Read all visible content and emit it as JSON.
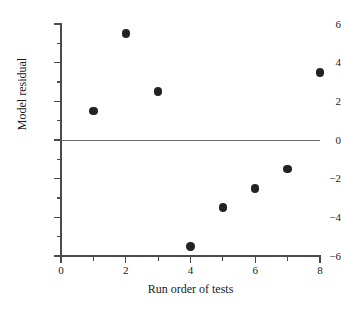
{
  "chart_data": {
    "type": "scatter",
    "title": "",
    "xlabel": "Run order of tests",
    "ylabel": "Model residual",
    "x": [
      1,
      2,
      3,
      4,
      5,
      6,
      7,
      8
    ],
    "values": [
      1.5,
      5.5,
      2.5,
      -5.5,
      -3.5,
      -2.5,
      -1.5,
      3.5
    ],
    "points": [
      {
        "x": 1,
        "y": 1.5
      },
      {
        "x": 2,
        "y": 5.5
      },
      {
        "x": 3,
        "y": 2.5
      },
      {
        "x": 4,
        "y": -5.5
      },
      {
        "x": 5,
        "y": -3.5
      },
      {
        "x": 6,
        "y": -2.5
      },
      {
        "x": 7,
        "y": -1.5
      },
      {
        "x": 8,
        "y": 3.5
      }
    ],
    "xlim": [
      0,
      8
    ],
    "ylim": [
      -6,
      6
    ],
    "x_major_ticks": [
      0,
      2,
      4,
      6,
      8
    ],
    "x_minor_ticks": [
      1,
      3,
      5,
      7
    ],
    "x_tick_labels": [
      "0",
      "2",
      "4",
      "6",
      "8"
    ],
    "y_major_ticks": [
      6,
      4,
      2,
      0,
      -2,
      -4,
      -6
    ],
    "y_minor_ticks": [
      5,
      3,
      1,
      -1,
      -3,
      -5
    ],
    "y_tick_labels": [
      "6",
      "4",
      "2",
      "0",
      "−2",
      "−4",
      "−6"
    ],
    "grid": false,
    "legend": null,
    "reference_lines": [
      {
        "axis": "y",
        "value": 0
      }
    ],
    "marker": {
      "shape": "circle",
      "filled": true,
      "color": "#232323"
    },
    "colors": {
      "axis": "#4a4a4a",
      "zero_line": "#6b6b6b",
      "marker": "#232323",
      "text": "#1a1a1a",
      "background": "#ffffff"
    }
  }
}
